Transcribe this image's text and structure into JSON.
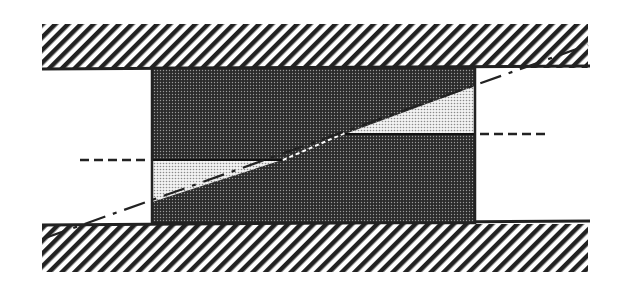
{
  "diagram": {
    "title": "",
    "colors": {
      "background": "#ffffff",
      "line": "#222222",
      "dark_fill": "#3a3a3a",
      "light_fill": "#d8d8d8",
      "hatch": "#222222"
    },
    "elements": [
      {
        "id": "top-plate",
        "type": "hatched-region",
        "x": 42,
        "y": 24,
        "w": 546,
        "h": 44
      },
      {
        "id": "bottom-plate",
        "type": "hatched-region",
        "x": 42,
        "y": 224,
        "w": 546,
        "h": 48
      },
      {
        "id": "block",
        "type": "rect",
        "x": 152,
        "y": 68,
        "w": 323,
        "h": 155
      },
      {
        "id": "inclined-plane",
        "type": "dash-dot-line",
        "x1": 45,
        "y1": 238,
        "x2": 588,
        "y2": 45
      },
      {
        "id": "left-reference-line",
        "type": "dashed-line",
        "x1": 80,
        "y1": 160,
        "x2": 148,
        "y2": 160
      },
      {
        "id": "right-reference-line",
        "type": "dashed-line",
        "x1": 480,
        "y1": 134,
        "x2": 545,
        "y2": 134
      }
    ]
  }
}
